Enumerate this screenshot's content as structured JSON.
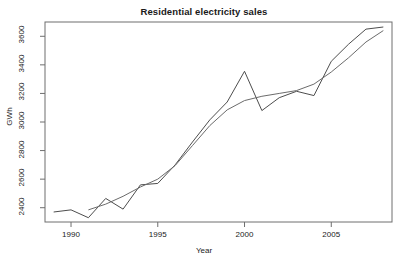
{
  "chart_data": {
    "type": "line",
    "title": "Residential electricity sales",
    "xlabel": "Year",
    "ylabel": "GWh",
    "xlim": [
      1988.5,
      2008.5
    ],
    "ylim": [
      2300,
      3700
    ],
    "grid": false,
    "legend": "none",
    "x_ticks": [
      1990,
      1995,
      2000,
      2005
    ],
    "y_ticks": [
      2400,
      2600,
      2800,
      3000,
      3200,
      3400,
      3600
    ],
    "x": [
      1989,
      1990,
      1991,
      1992,
      1993,
      1994,
      1995,
      1996,
      1997,
      1998,
      1999,
      2000,
      2001,
      2002,
      2003,
      2004,
      2005,
      2006,
      2007,
      2008
    ],
    "series": [
      {
        "name": "Residential electricity sales",
        "kind": "observed",
        "color": "#4d4d4d",
        "values": [
          2370,
          2385,
          2330,
          2465,
          2390,
          2560,
          2570,
          2700,
          2860,
          3015,
          3140,
          3355,
          3080,
          3170,
          3215,
          3185,
          3425,
          3545,
          3650,
          3665
        ]
      },
      {
        "name": "Smooth trend",
        "kind": "trend",
        "color": "#6b6b6b",
        "x": [
          1991,
          1992,
          1993,
          1994,
          1995,
          1996,
          1997,
          1998,
          1999,
          2000,
          2001,
          2002,
          2003,
          2004,
          2005,
          2006,
          2007,
          2008
        ],
        "values": [
          2385,
          2425,
          2480,
          2545,
          2600,
          2695,
          2835,
          2975,
          3085,
          3150,
          3180,
          3200,
          3220,
          3265,
          3350,
          3450,
          3560,
          3640
        ]
      }
    ]
  },
  "ticks": {
    "x_labels": [
      "1990",
      "1995",
      "2000",
      "2005"
    ],
    "y_labels": [
      "2400",
      "2600",
      "2800",
      "3000",
      "3200",
      "3400",
      "3600"
    ]
  },
  "footer": {
    "watermark": ""
  }
}
